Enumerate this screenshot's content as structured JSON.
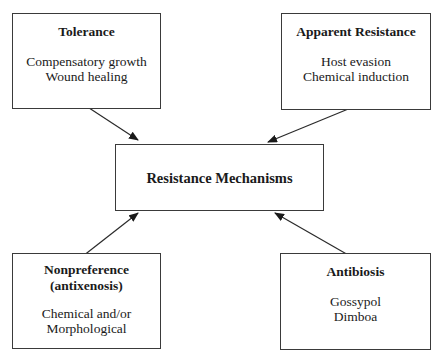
{
  "diagram": {
    "center": {
      "title": "Resistance Mechanisms"
    },
    "nodes": [
      {
        "id": "tolerance",
        "title": "Tolerance",
        "title2": "",
        "lines": [
          "Compensatory growth",
          "Wound healing"
        ]
      },
      {
        "id": "apparent-resistance",
        "title": "Apparent Resistance",
        "title2": "",
        "lines": [
          "Host evasion",
          "Chemical induction"
        ]
      },
      {
        "id": "nonpreference",
        "title": "Nonpreference",
        "title2": "(antixenosis)",
        "lines": [
          "Chemical and/or",
          "Morphological"
        ]
      },
      {
        "id": "antibiosis",
        "title": "Antibiosis",
        "title2": "",
        "lines": [
          "Gossypol",
          "Dimboa"
        ]
      }
    ],
    "edges": [
      {
        "from": "tolerance",
        "to": "center"
      },
      {
        "from": "apparent-resistance",
        "to": "center"
      },
      {
        "from": "nonpreference",
        "to": "center"
      },
      {
        "from": "antibiosis",
        "to": "center"
      }
    ],
    "colors": {
      "line": "#2a2a2a",
      "border": "#3a3a3a",
      "text": "#1a1a1a",
      "background": "#ffffff"
    }
  }
}
